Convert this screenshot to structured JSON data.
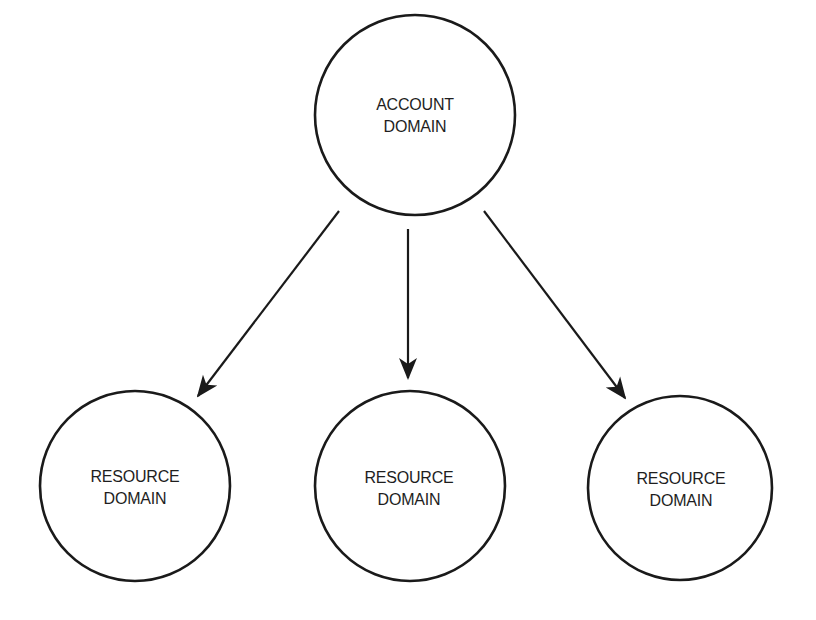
{
  "diagram": {
    "type": "hierarchy",
    "colors": {
      "stroke": "#1a1a1a",
      "text": "#1e1e1e",
      "background": "#ffffff"
    },
    "root": {
      "id": "account-domain",
      "label_line1": "ACCOUNT",
      "label_line2": "DOMAIN"
    },
    "children": [
      {
        "id": "resource-domain-left",
        "label_line1": "RESOURCE",
        "label_line2": "DOMAIN"
      },
      {
        "id": "resource-domain-middle",
        "label_line1": "RESOURCE",
        "label_line2": "DOMAIN"
      },
      {
        "id": "resource-domain-right",
        "label_line1": "RESOURCE",
        "label_line2": "DOMAIN"
      }
    ],
    "edges": [
      {
        "from": "account-domain",
        "to": "resource-domain-left",
        "direction": "arrow-to-child"
      },
      {
        "from": "account-domain",
        "to": "resource-domain-middle",
        "direction": "arrow-to-child"
      },
      {
        "from": "account-domain",
        "to": "resource-domain-right",
        "direction": "arrow-to-child"
      }
    ]
  }
}
